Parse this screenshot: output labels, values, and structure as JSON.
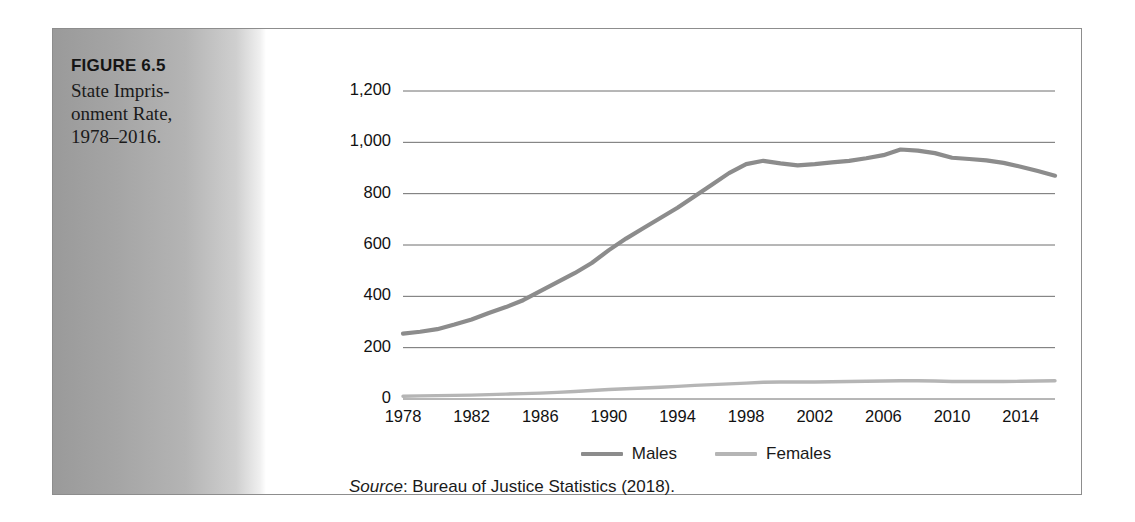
{
  "figure": {
    "label": "FIGURE 6.5",
    "title_lines": [
      "State Impris-",
      "onment Rate,",
      "1978–2016."
    ]
  },
  "source": {
    "word": "Source",
    "rest": ": Bureau of Justice Statistics (2018)."
  },
  "colors": {
    "males_line": "#8c8c8c",
    "females_line": "#b5b5b5",
    "gridline": "#6e6e6e",
    "frame_border": "#8d8d8d",
    "panel_dark": "#9a9a9a",
    "panel_light": "#ffffff",
    "text": "#111111"
  },
  "chart_data": {
    "type": "line",
    "xlabel": "",
    "ylabel": "",
    "ylim": [
      0,
      1200
    ],
    "xlim": [
      1978,
      2016
    ],
    "ytick_labels": [
      "1,200",
      "1,000",
      "800",
      "600",
      "400",
      "200",
      "0"
    ],
    "ytick_values": [
      1200,
      1000,
      800,
      600,
      400,
      200,
      0
    ],
    "xtick_labels": [
      "1978",
      "1982",
      "1986",
      "1990",
      "1994",
      "1998",
      "2002",
      "2006",
      "2010",
      "2014"
    ],
    "xtick_values": [
      1978,
      1982,
      1986,
      1990,
      1994,
      1998,
      2002,
      2006,
      2010,
      2014
    ],
    "grid": true,
    "legend_position": "bottom-center",
    "x": [
      1978,
      1979,
      1980,
      1981,
      1982,
      1983,
      1984,
      1985,
      1986,
      1987,
      1988,
      1989,
      1990,
      1991,
      1992,
      1993,
      1994,
      1995,
      1996,
      1997,
      1998,
      1999,
      2000,
      2001,
      2002,
      2003,
      2004,
      2005,
      2006,
      2007,
      2008,
      2009,
      2010,
      2011,
      2012,
      2013,
      2014,
      2015,
      2016
    ],
    "series": [
      {
        "name": "Males",
        "color": "#8c8c8c",
        "values": [
          255,
          262,
          272,
          290,
          310,
          335,
          358,
          385,
          420,
          455,
          490,
          530,
          580,
          625,
          665,
          705,
          745,
          790,
          835,
          880,
          915,
          928,
          918,
          910,
          915,
          922,
          928,
          938,
          950,
          972,
          968,
          958,
          940,
          935,
          930,
          920,
          905,
          888,
          870
        ]
      },
      {
        "name": "Females",
        "color": "#b5b5b5",
        "values": [
          11,
          12,
          13,
          14,
          15,
          17,
          19,
          21,
          23,
          26,
          29,
          33,
          37,
          40,
          43,
          46,
          49,
          53,
          56,
          59,
          62,
          65,
          66,
          66,
          66,
          67,
          68,
          69,
          70,
          71,
          71,
          70,
          68,
          68,
          68,
          68,
          69,
          70,
          71
        ]
      }
    ]
  }
}
